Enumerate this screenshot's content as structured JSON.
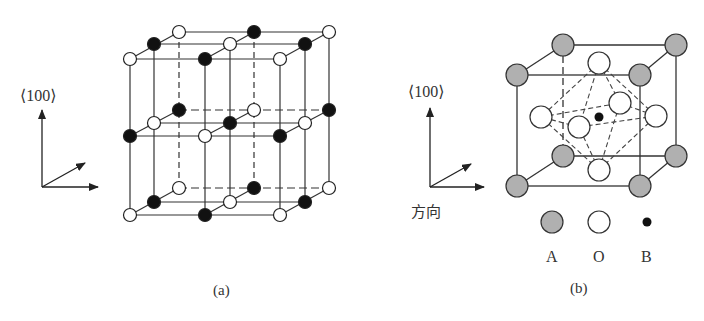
{
  "figure": {
    "panel_a": {
      "caption": "(a)",
      "axis_label": "⟨100⟩",
      "description": "Rock-salt type lattice: alternating black and white atoms on a 3x3x3 grid",
      "atom_colors": {
        "black": "#111111",
        "white": "#ffffff"
      }
    },
    "panel_b": {
      "caption": "(b)",
      "axis_label": "⟨100⟩",
      "axis_direction_label": "方向",
      "description": "Perovskite ABO3 unit cell with BO6 octahedron",
      "legend": [
        {
          "symbol": "A",
          "color": "#b0b0b0",
          "label": "A"
        },
        {
          "symbol": "O",
          "color": "#ffffff",
          "label": "O"
        },
        {
          "symbol": "B",
          "color": "#111111",
          "label": "B"
        }
      ]
    }
  }
}
